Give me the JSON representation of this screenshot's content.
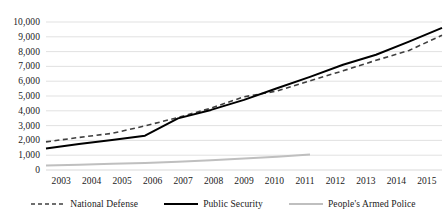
{
  "chart_data": {
    "type": "line",
    "title": "",
    "xlabel": "",
    "ylabel": "",
    "categories": [
      2003,
      2004,
      2005,
      2006,
      2007,
      2008,
      2009,
      2010,
      2011,
      2012,
      2013,
      2014,
      2015
    ],
    "ylim": [
      0,
      10000
    ],
    "ytick_step": 1000,
    "yticks": [
      "10,000",
      "9,000",
      "8,000",
      "7,000",
      "6,000",
      "5,000",
      "4,000",
      "3,000",
      "2,000",
      "1,000",
      "0"
    ],
    "ytick_values": [
      10000,
      9000,
      8000,
      7000,
      6000,
      5000,
      4000,
      3000,
      2000,
      1000,
      0
    ],
    "xticks": [
      "2003",
      "2004",
      "2005",
      "2006",
      "2007",
      "2008",
      "2009",
      "2010",
      "2011",
      "2012",
      "2013",
      "2014",
      "2015"
    ],
    "grid": "horizontal",
    "legend_position": "bottom",
    "series": [
      {
        "name": "National Defense",
        "style": "dashed",
        "color": "#3f3f3f",
        "values": [
          1900,
          2200,
          2475,
          2980,
          3550,
          4180,
          4950,
          5330,
          6030,
          6700,
          7410,
          8080,
          9100
        ]
      },
      {
        "name": "Public Security",
        "style": "solid",
        "color": "#000000",
        "values": [
          1450,
          1760,
          2030,
          2320,
          3490,
          4060,
          4740,
          5520,
          6290,
          7110,
          7790,
          8670,
          9600
        ]
      },
      {
        "name": "People's Armed Police",
        "style": "solid",
        "color": "#bfbfbf",
        "values": [
          300,
          360,
          420,
          480,
          560,
          660,
          780,
          900,
          1050,
          null,
          null,
          null,
          null
        ]
      }
    ]
  },
  "legend": {
    "items": [
      {
        "label": "National Defense",
        "style": "dashed",
        "color": "#3f3f3f"
      },
      {
        "label": "Public Security",
        "style": "solid",
        "color": "#000000"
      },
      {
        "label": "People's Armed Police",
        "style": "solid",
        "color": "#bfbfbf"
      }
    ]
  },
  "colors": {
    "grid": "#d9d9d9",
    "axis": "#d9d9d9",
    "background": "#ffffff",
    "text": "#1a1a1a"
  }
}
